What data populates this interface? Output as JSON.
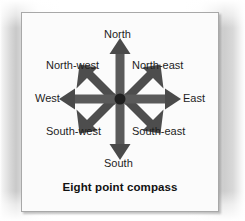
{
  "figure": {
    "caption": "Eight point compass",
    "arrow_color": "#555555",
    "arrow_color_dark": "#3d3d3d",
    "panel_background": "#fbfbfb",
    "panel_border_color": "#a8a8a8",
    "text_color": "#1d1d1d"
  },
  "compass": {
    "center": {
      "x": 98,
      "y": 86
    },
    "points": [
      {
        "id": "north",
        "label": "North",
        "bearing_degrees": 0,
        "kind": "cardinal"
      },
      {
        "id": "north-east",
        "label": "North-east",
        "bearing_degrees": 45,
        "kind": "ordinal"
      },
      {
        "id": "east",
        "label": "East",
        "bearing_degrees": 90,
        "kind": "cardinal"
      },
      {
        "id": "south-east",
        "label": "South-east",
        "bearing_degrees": 135,
        "kind": "ordinal"
      },
      {
        "id": "south",
        "label": "South",
        "bearing_degrees": 180,
        "kind": "cardinal"
      },
      {
        "id": "south-west",
        "label": "South-west",
        "bearing_degrees": 225,
        "kind": "ordinal"
      },
      {
        "id": "west",
        "label": "West",
        "bearing_degrees": 270,
        "kind": "cardinal"
      },
      {
        "id": "north-west",
        "label": "North-west",
        "bearing_degrees": 315,
        "kind": "ordinal"
      }
    ]
  }
}
